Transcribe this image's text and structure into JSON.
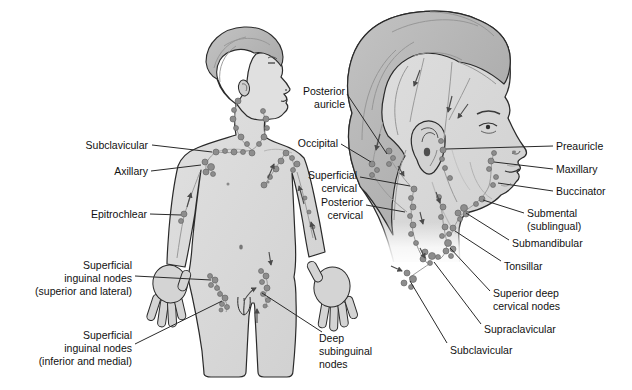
{
  "diagram": {
    "colors": {
      "background": "#ffffff",
      "outline": "#2a2a2a",
      "skin": "#d9d9d9",
      "hair": "#b3b3b3",
      "node": "#8d8d8d",
      "vessel": "#9a9a9a",
      "label_text": "#111111"
    }
  },
  "labels": {
    "subclavicular_body": {
      "text": "Subclavicular"
    },
    "axillary": {
      "text": "Axillary"
    },
    "epitrochlear": {
      "text": "Epitrochlear"
    },
    "superficial_inguinal_superior": {
      "line1": "Superficial",
      "line2": "inguinal nodes",
      "line3": "(superior and lateral)"
    },
    "superficial_inguinal_inferior": {
      "line1": "Superficial",
      "line2": "inguinal nodes",
      "line3": "(inferior and medial)"
    },
    "deep_subinguinal": {
      "line1": "Deep",
      "line2": "subinguinal",
      "line3": "nodes"
    },
    "posterior_auricle": {
      "line1": "Posterior",
      "line2": "auricle"
    },
    "occipital": {
      "text": "Occipital"
    },
    "superficial_cervical": {
      "line1": "Superficial",
      "line2": "cervical"
    },
    "posterior_cervical": {
      "line1": "Posterior",
      "line2": "cervical"
    },
    "preauricle": {
      "text": "Preauricle"
    },
    "maxillary": {
      "text": "Maxillary"
    },
    "buccinator": {
      "text": "Buccinator"
    },
    "submental": {
      "line1": "Submental",
      "line2": "(sublingual)"
    },
    "submandibular": {
      "text": "Submandibular"
    },
    "tonsillar": {
      "text": "Tonsillar"
    },
    "superior_deep_cervical": {
      "line1": "Superior deep",
      "line2": "cervical nodes"
    },
    "supraclavicular": {
      "text": "Supraclavicular"
    },
    "subclavicular_head": {
      "text": "Subclavicular"
    }
  }
}
